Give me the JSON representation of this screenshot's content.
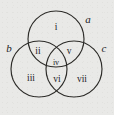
{
  "figure": {
    "type": "venn-diagram",
    "background_color": "#e9e9e7",
    "stroke_color": "#2c2b28",
    "set_labels": [
      {
        "id": "a",
        "text": "a",
        "x": 88,
        "y": 19,
        "description": "top circle label"
      },
      {
        "id": "b",
        "text": "b",
        "x": 9,
        "y": 48,
        "description": "bottom-left circle label"
      },
      {
        "id": "c",
        "text": "c",
        "x": 104,
        "y": 48,
        "description": "bottom-right circle label"
      }
    ],
    "region_labels": [
      {
        "id": "i",
        "text": "i",
        "x": 56,
        "y": 28
      },
      {
        "id": "ii",
        "text": "ii",
        "x": 38,
        "y": 52
      },
      {
        "id": "v",
        "text": "v",
        "x": 69,
        "y": 52
      },
      {
        "id": "iv",
        "text": "iv",
        "x": 56,
        "y": 63
      },
      {
        "id": "iii",
        "text": "iii",
        "x": 31,
        "y": 79
      },
      {
        "id": "vi",
        "text": "vi",
        "x": 57,
        "y": 80
      },
      {
        "id": "vii",
        "text": "vii",
        "x": 82,
        "y": 80
      }
    ],
    "circles": [
      {
        "id": "circle-a",
        "cx": 56,
        "cy": 39,
        "r": 28
      },
      {
        "id": "circle-b",
        "cx": 39,
        "cy": 69,
        "r": 28
      },
      {
        "id": "circle-c",
        "cx": 74,
        "cy": 69,
        "r": 28
      }
    ]
  }
}
